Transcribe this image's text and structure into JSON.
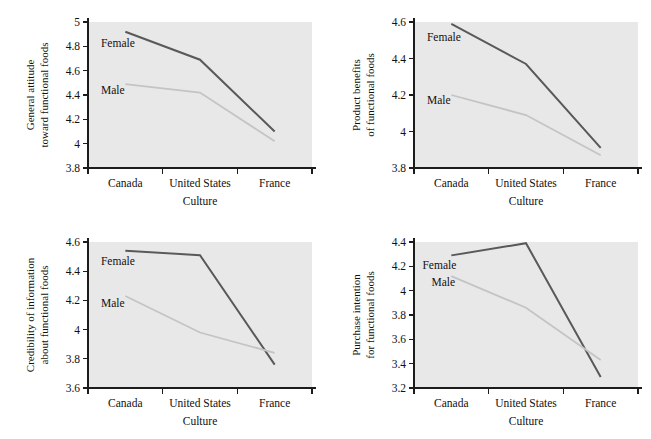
{
  "figure": {
    "type": "multi-panel-line-chart",
    "panel_count": 4,
    "layout": "2x2",
    "shared_xlabel": "Culture",
    "shared_categories": [
      "Canada",
      "United States",
      "France"
    ],
    "series_names": [
      "Female",
      "Male"
    ],
    "colors": {
      "female_line": "#595959",
      "male_line": "#c4c4c4",
      "plot_background": "#e8e8e8",
      "axis": "#1c1c1c",
      "text": "#111111",
      "figure_background": "#ffffff"
    }
  },
  "chart_data": [
    {
      "type": "line",
      "panel": "top-left",
      "title": "",
      "ylabel_lines": [
        "General attitude",
        "toward functional foods"
      ],
      "ylabel": "General attitude toward functional foods",
      "xlabel": "Culture",
      "categories": [
        "Canada",
        "United States",
        "France"
      ],
      "ylim": [
        3.8,
        5.0
      ],
      "yticks": [
        3.8,
        4.0,
        4.2,
        4.4,
        4.6,
        4.8,
        5.0
      ],
      "ytick_labels": [
        "3.8",
        "4",
        "4.2",
        "4.4",
        "4.6",
        "4.8",
        "5"
      ],
      "grid": false,
      "legend_position": "inline-labels",
      "series": [
        {
          "name": "Female",
          "values": [
            4.92,
            4.69,
            4.1
          ],
          "color": "#595959"
        },
        {
          "name": "Male",
          "values": [
            4.49,
            4.42,
            4.02
          ],
          "color": "#c4c4c4"
        }
      ]
    },
    {
      "type": "line",
      "panel": "top-right",
      "title": "",
      "ylabel_lines": [
        "Product benefits",
        "of functional foods"
      ],
      "ylabel": "Product benefits of functional foods",
      "xlabel": "Culture",
      "categories": [
        "Canada",
        "United States",
        "France"
      ],
      "ylim": [
        3.8,
        4.6
      ],
      "yticks": [
        3.8,
        4.0,
        4.2,
        4.4,
        4.6
      ],
      "ytick_labels": [
        "3.8",
        "4",
        "4.2",
        "4.4",
        "4.6"
      ],
      "grid": false,
      "legend_position": "inline-labels",
      "series": [
        {
          "name": "Female",
          "values": [
            4.59,
            4.37,
            3.91
          ],
          "color": "#595959"
        },
        {
          "name": "Male",
          "values": [
            4.2,
            4.09,
            3.87
          ],
          "color": "#c4c4c4"
        }
      ]
    },
    {
      "type": "line",
      "panel": "bottom-left",
      "title": "",
      "ylabel_lines": [
        "Credibility of information",
        "about functional foods"
      ],
      "ylabel": "Credibility of information about functional foods",
      "xlabel": "Culture",
      "categories": [
        "Canada",
        "United States",
        "France"
      ],
      "ylim": [
        3.6,
        4.6
      ],
      "yticks": [
        3.6,
        3.8,
        4.0,
        4.2,
        4.4,
        4.6
      ],
      "ytick_labels": [
        "3.6",
        "3.8",
        "4",
        "4.2",
        "4.4",
        "4.6"
      ],
      "grid": false,
      "legend_position": "inline-labels",
      "series": [
        {
          "name": "Female",
          "values": [
            4.54,
            4.51,
            3.76
          ],
          "color": "#595959"
        },
        {
          "name": "Male",
          "values": [
            4.23,
            3.98,
            3.84
          ],
          "color": "#c4c4c4"
        }
      ]
    },
    {
      "type": "line",
      "panel": "bottom-right",
      "title": "",
      "ylabel_lines": [
        "Purchase intention",
        "for functional foods"
      ],
      "ylabel": "Purchase intention for functional foods",
      "xlabel": "Culture",
      "categories": [
        "Canada",
        "United States",
        "France"
      ],
      "ylim": [
        3.2,
        4.4
      ],
      "yticks": [
        3.2,
        3.4,
        3.6,
        3.8,
        4.0,
        4.2,
        4.4
      ],
      "ytick_labels": [
        "3.2",
        "3.4",
        "3.6",
        "3.8",
        "4",
        "4.2",
        "4.4"
      ],
      "grid": false,
      "legend_position": "inline-labels",
      "series": [
        {
          "name": "Female",
          "values": [
            4.29,
            4.39,
            3.29
          ],
          "color": "#595959"
        },
        {
          "name": "Male",
          "values": [
            4.12,
            3.86,
            3.43
          ],
          "color": "#c4c4c4"
        }
      ]
    }
  ],
  "panel_label_anchors": [
    {
      "female": {
        "x": 0.04,
        "y": 4.83
      },
      "male": {
        "x": 0.04,
        "y": 4.44
      }
    },
    {
      "female": {
        "x": 0.04,
        "y": 4.52
      },
      "male": {
        "x": 0.04,
        "y": 4.17
      }
    },
    {
      "female": {
        "x": 0.04,
        "y": 4.47
      },
      "male": {
        "x": 0.04,
        "y": 4.18
      }
    },
    {
      "female": {
        "x": 0.02,
        "y": 4.21
      },
      "male": {
        "x": 0.06,
        "y": 4.07
      }
    }
  ]
}
